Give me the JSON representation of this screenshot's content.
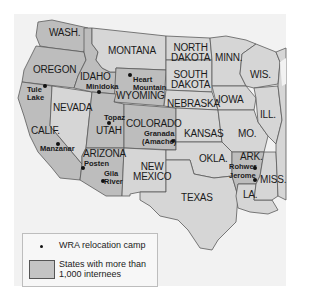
{
  "map": {
    "type": "thematic-map",
    "subject": "WRA relocation camps in the western United States",
    "states": [
      {
        "label": "WASH.",
        "shaded": true
      },
      {
        "label": "OREGON",
        "shaded": true
      },
      {
        "label": "CALIF.",
        "shaded": true
      },
      {
        "label": "IDAHO",
        "shaded": true
      },
      {
        "label": "NEVADA",
        "shaded": false
      },
      {
        "label": "MONTANA",
        "shaded": false
      },
      {
        "label": "WYOMING",
        "shaded": true
      },
      {
        "label": "UTAH",
        "shaded": true
      },
      {
        "label": "ARIZONA",
        "shaded": true
      },
      {
        "label": "COLORADO",
        "shaded": true
      },
      {
        "label": "NEW MEXICO",
        "shaded": false
      },
      {
        "label": "NORTH DAKOTA",
        "shaded": false
      },
      {
        "label": "SOUTH DAKOTA",
        "shaded": false
      },
      {
        "label": "NEBRASKA",
        "shaded": false
      },
      {
        "label": "KANSAS",
        "shaded": false
      },
      {
        "label": "OKLA.",
        "shaded": false
      },
      {
        "label": "TEXAS",
        "shaded": false
      },
      {
        "label": "MINN.",
        "shaded": false
      },
      {
        "label": "IOWA",
        "shaded": false
      },
      {
        "label": "MO.",
        "shaded": false
      },
      {
        "label": "ARK.",
        "shaded": true
      },
      {
        "label": "LA.",
        "shaded": false
      },
      {
        "label": "WIS.",
        "shaded": false
      },
      {
        "label": "ILL.",
        "shaded": false
      },
      {
        "label": "MISS.",
        "shaded": false
      }
    ],
    "labels": {
      "wash": "WASH.",
      "oregon": "OREGON",
      "calif": "CALIF.",
      "idaho": "IDAHO",
      "nevada": "NEVADA",
      "montana": "MONTANA",
      "wyoming": "WYOMING",
      "utah": "UTAH",
      "arizona": "ARIZONA",
      "colorado": "COLORADO",
      "new_mexico_1": "NEW",
      "new_mexico_2": "MEXICO",
      "north_dakota_1": "NORTH",
      "north_dakota_2": "DAKOTA",
      "south_dakota_1": "SOUTH",
      "south_dakota_2": "DAKOTA",
      "nebraska": "NEBRASKA",
      "kansas": "KANSAS",
      "okla": "OKLA.",
      "texas": "TEXAS",
      "minn": "MINN.",
      "iowa": "IOWA",
      "mo": "MO.",
      "ark": "ARK.",
      "la": "LA.",
      "wis": "WIS.",
      "ill": "ILL.",
      "miss": "MISS."
    },
    "camps": {
      "tule_lake_1": "Tule",
      "tule_lake_2": "Lake",
      "minidoka": "Minidoka",
      "heart_mountain_1": "Heart",
      "heart_mountain_2": "Mountain",
      "topaz": "Topaz",
      "manzanar": "Manzanar",
      "posten": "Posten",
      "gila_river_1": "Gila",
      "gila_river_2": "River",
      "granada_1": "Granada",
      "granada_2": "(Amache)",
      "rohwer": "Rohwer",
      "jerome": "Jerome"
    },
    "colors": {
      "shaded_state": "#bdbdbd",
      "other_state": "#d6d6d6",
      "border": "#5a5a5a",
      "background": "#f2f2f2"
    }
  },
  "legend": {
    "camp_label": "WRA relocation camp",
    "shaded_label_1": "States with more than",
    "shaded_label_2": "1,000 internees"
  }
}
